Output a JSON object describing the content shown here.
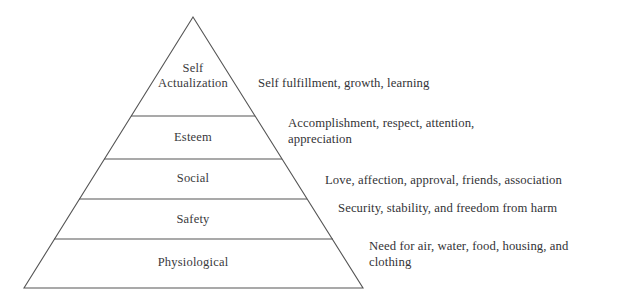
{
  "diagram": {
    "type": "pyramid",
    "name": "maslow-hierarchy-of-needs",
    "stroke_color": "#555555",
    "fill_color": "#ffffff",
    "background_color": "#ffffff",
    "apex": {
      "x": 193,
      "y": 17
    },
    "base_left": {
      "x": 24,
      "y": 288
    },
    "base_right": {
      "x": 363,
      "y": 288
    },
    "divider_y": [
      116,
      159,
      199,
      239
    ],
    "levels": [
      {
        "id": "self-actualization",
        "rank": 5,
        "label_line1": "Self",
        "label_line2": "Actualization",
        "description_line1": "Self fulfillment, growth, learning",
        "description_line2": ""
      },
      {
        "id": "esteem",
        "rank": 4,
        "label_line1": "Esteem",
        "label_line2": "",
        "description_line1": "Accomplishment, respect, attention,",
        "description_line2": "appreciation"
      },
      {
        "id": "social",
        "rank": 3,
        "label_line1": "Social",
        "label_line2": "",
        "description_line1": "Love, affection, approval, friends, association",
        "description_line2": ""
      },
      {
        "id": "safety",
        "rank": 2,
        "label_line1": "Safety",
        "label_line2": "",
        "description_line1": "Security, stability, and freedom from harm",
        "description_line2": ""
      },
      {
        "id": "physiological",
        "rank": 1,
        "label_line1": "Physiological",
        "label_line2": "",
        "description_line1": "Need for air, water, food, housing, and",
        "description_line2": "clothing"
      }
    ]
  }
}
